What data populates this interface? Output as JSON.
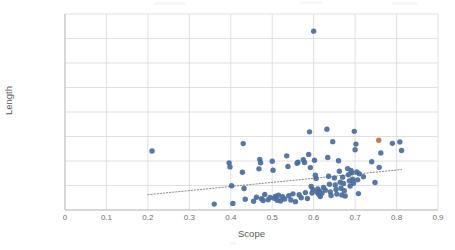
{
  "chart_data": {
    "type": "scatter",
    "title": "",
    "xlabel": "Scope",
    "ylabel": "Length",
    "xlim": [
      0,
      0.9
    ],
    "ylim": [
      0,
      160000
    ],
    "xticks": [
      "0",
      "0.1",
      "0.2",
      "0.3",
      "0.4",
      "0.5",
      "0.6",
      "0.7",
      "0.8",
      "0.9"
    ],
    "xtick_values": [
      0,
      0.1,
      0.2,
      0.3,
      0.4,
      0.5,
      0.6,
      0.7,
      0.8,
      0.9
    ],
    "yticks": [
      "0",
      "20000",
      "40000",
      "60000",
      "80000",
      "100000",
      "120000",
      "140000",
      "160000"
    ],
    "ytick_values": [
      0,
      20000,
      40000,
      60000,
      80000,
      100000,
      120000,
      140000,
      160000
    ],
    "grid": true,
    "legend": false,
    "marker_color": "#4A6C9B",
    "highlight_color": "#BE6A4A",
    "trendline": {
      "style": "dotted",
      "color": "#8c8c8c",
      "x_start": 0.2,
      "y_start": 12500,
      "x_end": 0.812,
      "y_end": 33000
    },
    "series": [
      {
        "name": "Projects",
        "color": "#4A6C9B",
        "points": [
          [
            0.21,
            48200
          ],
          [
            0.36,
            4800
          ],
          [
            0.396,
            38500
          ],
          [
            0.398,
            35200
          ],
          [
            0.402,
            19800
          ],
          [
            0.405,
            5400
          ],
          [
            0.43,
            54200
          ],
          [
            0.428,
            30800
          ],
          [
            0.432,
            17600
          ],
          [
            0.435,
            8800
          ],
          [
            0.455,
            7200
          ],
          [
            0.462,
            10400
          ],
          [
            0.468,
            33600
          ],
          [
            0.47,
            41200
          ],
          [
            0.472,
            38600
          ],
          [
            0.474,
            9200
          ],
          [
            0.478,
            7800
          ],
          [
            0.482,
            12600
          ],
          [
            0.49,
            8400
          ],
          [
            0.495,
            10200
          ],
          [
            0.5,
            39800
          ],
          [
            0.502,
            32400
          ],
          [
            0.505,
            9600
          ],
          [
            0.508,
            11200
          ],
          [
            0.512,
            8000
          ],
          [
            0.515,
            12000
          ],
          [
            0.52,
            7400
          ],
          [
            0.525,
            10800
          ],
          [
            0.53,
            9000
          ],
          [
            0.535,
            44200
          ],
          [
            0.538,
            35600
          ],
          [
            0.54,
            11600
          ],
          [
            0.545,
            8200
          ],
          [
            0.55,
            13200
          ],
          [
            0.556,
            6800
          ],
          [
            0.56,
            38200
          ],
          [
            0.562,
            39000
          ],
          [
            0.565,
            12400
          ],
          [
            0.57,
            10000
          ],
          [
            0.575,
            41000
          ],
          [
            0.578,
            38800
          ],
          [
            0.58,
            14200
          ],
          [
            0.585,
            9400
          ],
          [
            0.588,
            45400
          ],
          [
            0.59,
            63800
          ],
          [
            0.592,
            34600
          ],
          [
            0.594,
            19200
          ],
          [
            0.596,
            13800
          ],
          [
            0.598,
            16600
          ],
          [
            0.6,
            146000
          ],
          [
            0.602,
            40600
          ],
          [
            0.604,
            28400
          ],
          [
            0.606,
            25800
          ],
          [
            0.608,
            14600
          ],
          [
            0.61,
            17200
          ],
          [
            0.612,
            12800
          ],
          [
            0.614,
            15400
          ],
          [
            0.616,
            11000
          ],
          [
            0.62,
            13600
          ],
          [
            0.624,
            18400
          ],
          [
            0.628,
            16200
          ],
          [
            0.632,
            66000
          ],
          [
            0.634,
            42800
          ],
          [
            0.636,
            27600
          ],
          [
            0.638,
            21000
          ],
          [
            0.64,
            14800
          ],
          [
            0.642,
            11800
          ],
          [
            0.646,
            55800
          ],
          [
            0.65,
            26200
          ],
          [
            0.652,
            20400
          ],
          [
            0.654,
            16800
          ],
          [
            0.656,
            13000
          ],
          [
            0.66,
            40200
          ],
          [
            0.662,
            31600
          ],
          [
            0.664,
            22600
          ],
          [
            0.666,
            17800
          ],
          [
            0.668,
            12200
          ],
          [
            0.67,
            26800
          ],
          [
            0.672,
            21600
          ],
          [
            0.674,
            15800
          ],
          [
            0.676,
            11400
          ],
          [
            0.682,
            33800
          ],
          [
            0.684,
            28800
          ],
          [
            0.686,
            23800
          ],
          [
            0.688,
            19600
          ],
          [
            0.69,
            32200
          ],
          [
            0.692,
            30400
          ],
          [
            0.694,
            25200
          ],
          [
            0.696,
            21800
          ],
          [
            0.698,
            64200
          ],
          [
            0.7,
            49200
          ],
          [
            0.702,
            53800
          ],
          [
            0.704,
            31000
          ],
          [
            0.706,
            24600
          ],
          [
            0.708,
            13400
          ],
          [
            0.71,
            29600
          ],
          [
            0.72,
            27200
          ],
          [
            0.74,
            39400
          ],
          [
            0.748,
            22400
          ],
          [
            0.758,
            34800
          ],
          [
            0.762,
            46600
          ],
          [
            0.79,
            54400
          ],
          [
            0.808,
            55600
          ],
          [
            0.812,
            48600
          ]
        ]
      },
      {
        "name": "Highlighted project",
        "color": "#BE6A4A",
        "points": [
          [
            0.757,
            57000
          ]
        ]
      }
    ]
  }
}
